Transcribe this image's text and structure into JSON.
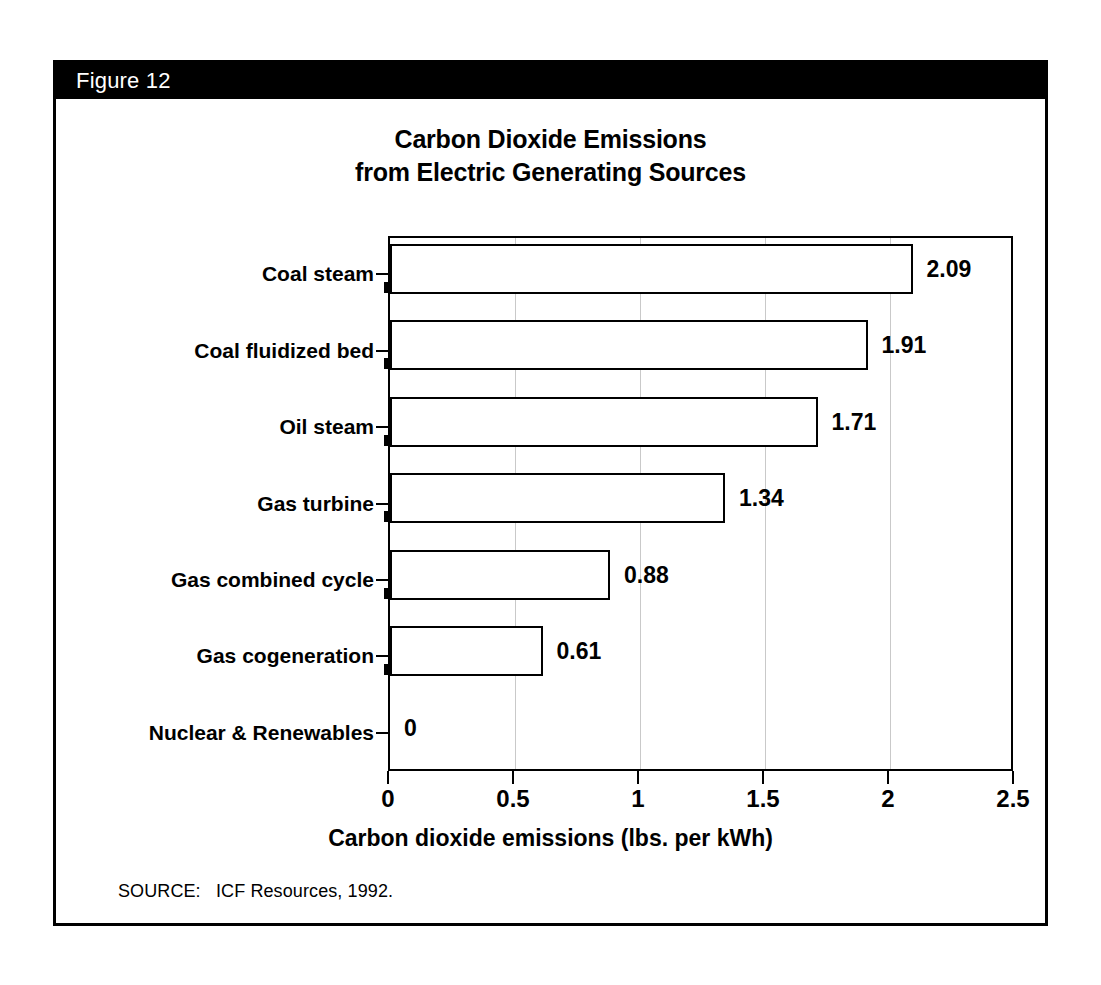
{
  "figure": {
    "number_label": "Figure 12",
    "source_note": "SOURCE:   ICF Resources, 1992."
  },
  "chart_data": {
    "type": "bar",
    "orientation": "horizontal",
    "title": "Carbon Dioxide Emissions from Electric Generating Sources",
    "title_lines": [
      "Carbon Dioxide Emissions",
      "from Electric Generating Sources"
    ],
    "categories": [
      "Coal steam",
      "Coal fluidized bed",
      "Oil steam",
      "Gas turbine",
      "Gas combined cycle",
      "Gas cogeneration",
      "Nuclear & Renewables"
    ],
    "values": [
      2.09,
      1.91,
      1.71,
      1.34,
      0.88,
      0.61,
      0
    ],
    "value_labels": [
      "2.09",
      "1.91",
      "1.71",
      "1.34",
      "0.88",
      "0.61",
      "0"
    ],
    "xlabel": "Carbon dioxide emissions (lbs. per kWh)",
    "ylabel": "",
    "xlim": [
      0,
      2.5
    ],
    "xticks": [
      0,
      0.5,
      1,
      1.5,
      2,
      2.5
    ],
    "xtick_labels": [
      "0",
      "0.5",
      "1",
      "1.5",
      "2",
      "2.5"
    ],
    "grid": "vertical-faint",
    "legend": null,
    "bar_fill": "#d8d8d8",
    "bar_edge": "#000000",
    "shadow_color": "#000000"
  }
}
